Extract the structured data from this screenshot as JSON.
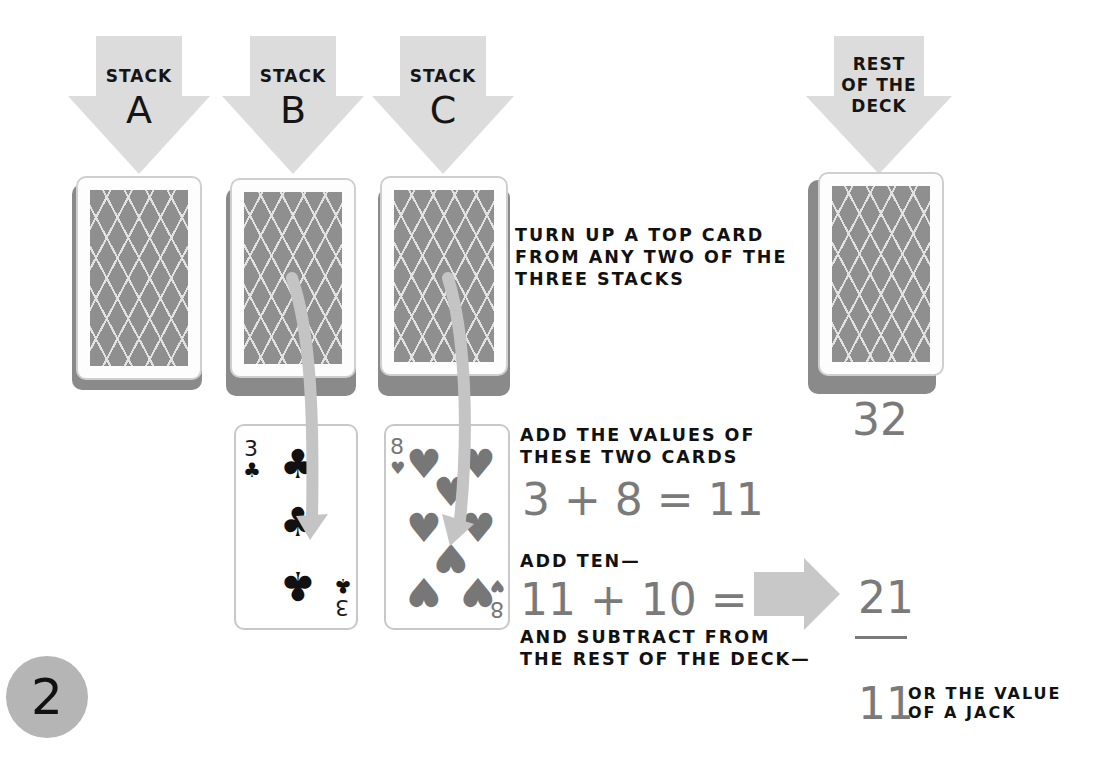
{
  "stacks": [
    {
      "label_small": "STACK",
      "label_big": "A"
    },
    {
      "label_small": "STACK",
      "label_big": "B"
    },
    {
      "label_small": "STACK",
      "label_big": "C"
    }
  ],
  "deck": {
    "label_lines": [
      "REST",
      "OF THE",
      "DECK"
    ],
    "count": "32"
  },
  "instructions": {
    "turn_up": [
      "TURN UP A TOP CARD",
      "FROM ANY TWO OF THE",
      "THREE STACKS"
    ],
    "add_values": [
      "ADD THE VALUES OF",
      "THESE TWO CARDS"
    ],
    "add_ten": "ADD TEN—",
    "subtract": [
      "AND SUBTRACT FROM",
      "THE REST OF THE DECK—"
    ]
  },
  "equations": {
    "sum_cards": "3 + 8 = 11",
    "plus_ten": "11 + 10 = 21"
  },
  "result": {
    "subtrahend": "21",
    "answer": "11",
    "answer_note": [
      "OR THE VALUE",
      "OF A JACK"
    ]
  },
  "revealed_cards": [
    {
      "rank": "3",
      "suit": "clubs",
      "suit_glyph": "♣"
    },
    {
      "rank": "8",
      "suit": "hearts",
      "suit_glyph": "♥"
    }
  ],
  "step": {
    "number": "2"
  },
  "colors": {
    "arrow_fill": "#d9d9d9",
    "card_back": "#8f8f8f",
    "accent_gray": "#7a7a7a",
    "badge": "#b5b5b5"
  }
}
